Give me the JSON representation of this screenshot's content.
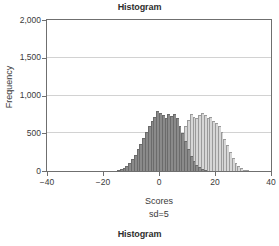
{
  "titles": {
    "top": "Histogram",
    "bottom": "Histogram"
  },
  "axes": {
    "ylabel": "Frequency",
    "xlabel": "Scores",
    "annotation": "sd=5",
    "yticks": [
      "0",
      "500",
      "1,000",
      "1,500",
      "2,000"
    ],
    "xticks": [
      "-40",
      "-20",
      "0",
      "20",
      "40"
    ]
  },
  "colors": {
    "series1_fill": "#8a8a8a",
    "series1_edge": "#6b6b6b",
    "series2_fill": "#d6d6d6",
    "series2_edge": "#9a9a9a",
    "frame": "#6f6f6f",
    "grid": "#d2d2d2",
    "background": "#ffffff",
    "text": "#3a3a3a"
  },
  "chart_data": {
    "type": "bar",
    "title": "Histogram",
    "subtitle": "Histogram",
    "xlabel": "Scores",
    "ylabel": "Frequency",
    "annotation": "sd=5",
    "xlim": [
      -40,
      40
    ],
    "ylim": [
      0,
      2000
    ],
    "ytick_values": [
      0,
      500,
      1000,
      1500,
      2000
    ],
    "xtick_values": [
      -40,
      -20,
      0,
      20,
      40
    ],
    "grid": "horizontal",
    "legend": "none",
    "bin_width": 1,
    "series": [
      {
        "name": "Group 1 (darker gray)",
        "fill": "#8a8a8a",
        "mean": 0,
        "sd": 5,
        "x": [
          -15,
          -14,
          -13,
          -12,
          -11,
          -10,
          -9,
          -8,
          -7,
          -6,
          -5,
          -4,
          -3,
          -2,
          -1,
          0,
          1,
          2,
          3,
          4,
          5,
          6,
          7,
          8,
          9,
          10,
          11,
          12,
          13,
          14,
          15,
          16
        ],
        "values": [
          10,
          25,
          45,
          70,
          110,
          160,
          215,
          290,
          360,
          440,
          520,
          600,
          660,
          720,
          790,
          770,
          740,
          700,
          760,
          730,
          755,
          700,
          600,
          500,
          395,
          290,
          205,
          135,
          85,
          50,
          25,
          10
        ]
      },
      {
        "name": "Group 2 (lighter gray)",
        "fill": "#d6d6d6",
        "mean": 14,
        "sd": 5,
        "x": [
          0,
          1,
          2,
          3,
          4,
          5,
          6,
          7,
          8,
          9,
          10,
          11,
          12,
          13,
          14,
          15,
          16,
          17,
          18,
          19,
          20,
          21,
          22,
          23,
          24,
          25,
          26,
          27,
          28,
          29,
          30,
          31
        ],
        "values": [
          15,
          30,
          55,
          90,
          140,
          200,
          290,
          390,
          500,
          600,
          680,
          760,
          720,
          700,
          740,
          775,
          745,
          700,
          710,
          660,
          640,
          590,
          520,
          430,
          340,
          250,
          170,
          110,
          65,
          35,
          18,
          8
        ]
      }
    ]
  }
}
